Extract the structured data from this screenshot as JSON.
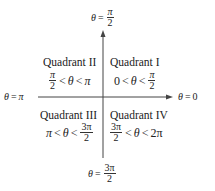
{
  "diagram": {
    "axes": {
      "top": {
        "lhs": "θ",
        "eq": "=",
        "num": "π",
        "den": "2"
      },
      "left": {
        "lhs": "θ",
        "eq": "=",
        "rhs": "π"
      },
      "right": {
        "lhs": "θ",
        "eq": "=",
        "rhs": "0"
      },
      "bottom": {
        "lhs": "θ",
        "eq": "=",
        "num": "3π",
        "den": "2"
      }
    },
    "quadrants": [
      {
        "name": "Quadrant I",
        "ineq": {
          "a": "0",
          "lt1": "<",
          "theta": "θ",
          "lt2": "<",
          "num": "π",
          "den": "2"
        }
      },
      {
        "name": "Quadrant II",
        "ineq": {
          "num": "π",
          "den": "2",
          "lt1": "<",
          "theta": "θ",
          "lt2": "<",
          "b": "π"
        }
      },
      {
        "name": "Quadrant III",
        "ineq": {
          "a": "π",
          "lt1": "<",
          "theta": "θ",
          "lt2": "<",
          "num": "3π",
          "den": "2"
        }
      },
      {
        "name": "Quadrant IV",
        "ineq": {
          "num": "3π",
          "den": "2",
          "lt1": "<",
          "theta": "θ",
          "lt2": "<",
          "b": "2π"
        }
      }
    ],
    "colors": {
      "line": "#444444",
      "text": "#222222",
      "background": "#ffffff"
    }
  }
}
